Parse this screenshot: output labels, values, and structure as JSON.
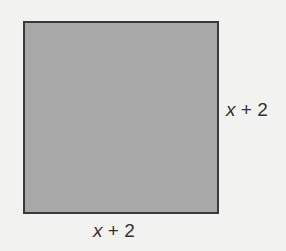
{
  "figure": {
    "shape": "square",
    "fill_color": "#a8a8a8",
    "border_color": "#3a3a3a",
    "background_color": "#f2f2f0",
    "side_label_right": {
      "variable": "x",
      "rest": " + 2"
    },
    "side_label_bottom": {
      "variable": "x",
      "rest": " + 2"
    }
  }
}
